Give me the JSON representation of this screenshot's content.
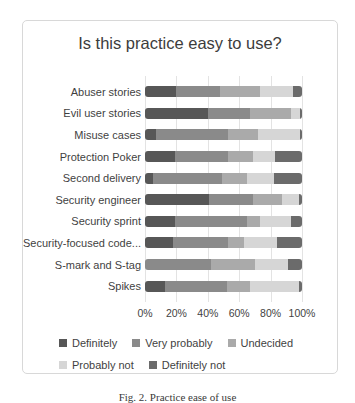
{
  "figure": {
    "caption": "Fig. 2. Practice ease of use"
  },
  "chart_data": {
    "type": "bar",
    "orientation": "horizontal",
    "stacked": true,
    "stacked_total": 100,
    "title": "Is this practice easy to use?",
    "categories": [
      "Abuser stories",
      "Evil user stories",
      "Misuse cases",
      "Protection Poker",
      "Second delivery",
      "Security engineer",
      "Security sprint",
      "Security-focused code...",
      "S-mark and S-tag",
      "Spikes"
    ],
    "series": [
      {
        "name": "Definitely",
        "color": "#575757",
        "values": [
          20,
          40,
          7,
          19,
          5,
          41,
          19,
          18,
          0,
          13
        ]
      },
      {
        "name": "Very probably",
        "color": "#8a8a8a",
        "values": [
          28,
          27,
          46,
          34,
          44,
          28,
          46,
          35,
          42,
          39
        ]
      },
      {
        "name": "Undecided",
        "color": "#aaaaaa",
        "values": [
          25,
          26,
          19,
          16,
          16,
          18,
          8,
          10,
          28,
          15
        ]
      },
      {
        "name": "Probably not",
        "color": "#d6d6d6",
        "values": [
          21,
          6,
          27,
          14,
          17,
          11,
          20,
          21,
          21,
          31
        ]
      },
      {
        "name": "Definitely not",
        "color": "#6b6b6b",
        "values": [
          6,
          1,
          1,
          17,
          18,
          2,
          7,
          16,
          9,
          2
        ]
      }
    ],
    "x_ticks": [
      "0%",
      "20%",
      "40%",
      "60%",
      "80%",
      "100%"
    ],
    "xlim": [
      0,
      100
    ],
    "grid": "vertical",
    "legend_position": "bottom"
  }
}
